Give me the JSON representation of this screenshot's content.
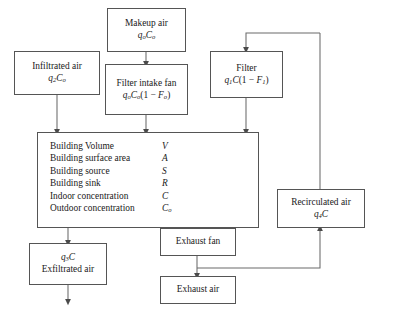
{
  "diagram": {
    "type": "flowchart",
    "background": "#ffffff",
    "line_color": "#555555",
    "box_border_color": "#555555"
  },
  "boxes": {
    "makeup_air": {
      "label": "Makeup air",
      "expr_q": "q",
      "expr_q_sub": "o",
      "expr_c": "C",
      "expr_c_sub": "o"
    },
    "infiltrated_air": {
      "label": "Infiltrated air",
      "expr_q": "q",
      "expr_q_sub": "2",
      "expr_c": "C",
      "expr_c_sub": "o"
    },
    "filter_intake_fan": {
      "label": "Filter intake fan",
      "expr_q": "q",
      "expr_q_sub": "o",
      "expr_c": "C",
      "expr_c_sub": "o",
      "expr_tail_open": "(1 − ",
      "expr_f": "F",
      "expr_f_sub": "o",
      "expr_tail_close": ")"
    },
    "filter": {
      "label": "Filter",
      "expr_q": "q",
      "expr_q_sub": "1",
      "expr_c": "C",
      "expr_tail_open": "(1 − ",
      "expr_f": "F",
      "expr_f_sub": "1",
      "expr_tail_close": ")"
    },
    "recirculated_air": {
      "label": "Recirculated air",
      "expr_q": "q",
      "expr_q_sub": "4",
      "expr_c": "C"
    },
    "exfiltrated_air": {
      "label": "Exfiltrated air",
      "expr_q": "q",
      "expr_q_sub": "3",
      "expr_c": "C"
    },
    "exhaust_fan": {
      "label": "Exhaust fan"
    },
    "exhaust_air": {
      "label": "Exhaust air"
    },
    "building": {
      "rows": [
        {
          "label": "Building Volume",
          "symbol": "V",
          "symbol_sub": ""
        },
        {
          "label": "Building surface area",
          "symbol": "A",
          "symbol_sub": ""
        },
        {
          "label": "Building source",
          "symbol": "S",
          "symbol_sub": ""
        },
        {
          "label": "Building sink",
          "symbol": "R",
          "symbol_sub": ""
        },
        {
          "label": "Indoor concentration",
          "symbol": "C",
          "symbol_sub": ""
        },
        {
          "label": "Outdoor concentration",
          "symbol": "C",
          "symbol_sub": "o"
        }
      ]
    }
  }
}
